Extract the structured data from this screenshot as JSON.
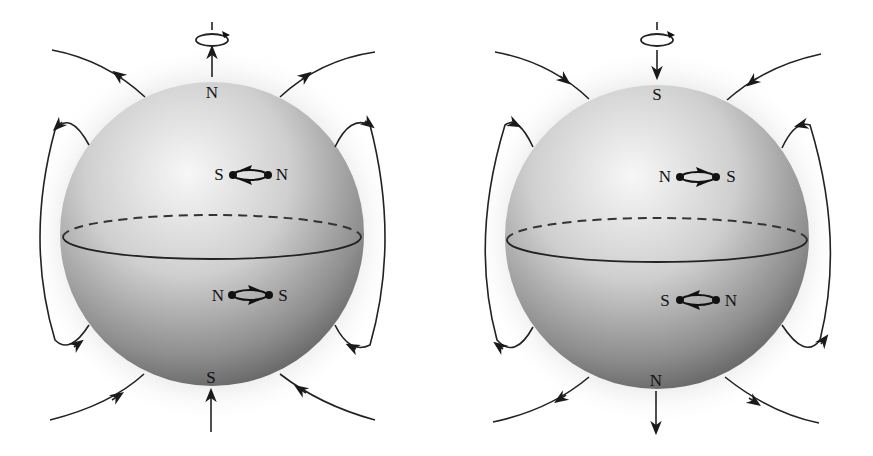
{
  "figure": {
    "panels": [
      {
        "id": "left",
        "description": "Sphere magnetized with north pole at top",
        "top_pole_label": "N",
        "bottom_pole_label": "S",
        "top_axis_arrow": "up",
        "bottom_axis_arrow": "up",
        "upper_dipole": {
          "left_label": "S",
          "right_label": "N"
        },
        "lower_dipole": {
          "left_label": "N",
          "right_label": "S"
        },
        "field_direction": "out of top, into bottom"
      },
      {
        "id": "right",
        "description": "Sphere magnetized with south pole at top",
        "top_pole_label": "S",
        "bottom_pole_label": "N",
        "top_axis_arrow": "down",
        "bottom_axis_arrow": "down",
        "upper_dipole": {
          "left_label": "N",
          "right_label": "S"
        },
        "lower_dipole": {
          "left_label": "S",
          "right_label": "N"
        },
        "field_direction": "into top, out of bottom"
      }
    ],
    "icons": [
      "rotation-arrow-icon",
      "axis-arrow-icon",
      "dipole-icon",
      "field-line-arrow-icon"
    ],
    "colors": {
      "line": "#222222",
      "sphere_light": "#f4f4f4",
      "sphere_dark": "#5a5a5a",
      "background": "#ffffff"
    }
  }
}
